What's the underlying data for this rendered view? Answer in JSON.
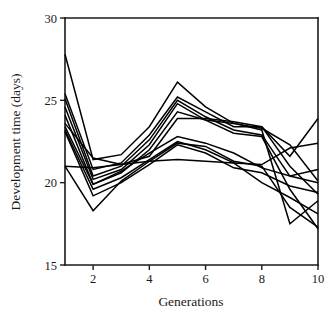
{
  "chart_data": {
    "type": "line",
    "title": "",
    "xlabel": "Generations",
    "ylabel": "Development time (days)",
    "xlim": [
      1,
      10
    ],
    "ylim": [
      15,
      30
    ],
    "x": [
      1,
      2,
      3,
      4,
      5,
      6,
      7,
      8,
      9,
      10
    ],
    "xticks": [
      2,
      4,
      6,
      8,
      10
    ],
    "xtick_labels": [
      "2",
      "4",
      "6",
      "8",
      "10"
    ],
    "yticks": [
      15,
      20,
      25,
      30
    ],
    "ytick_labels": [
      "15",
      "20",
      "25",
      "30"
    ],
    "grid": false,
    "legend": "none",
    "line_color": "#000000",
    "series": [
      {
        "name": "replicate-1",
        "values": [
          27.8,
          21.4,
          21.7,
          23.4,
          26.1,
          24.6,
          23.6,
          23.3,
          22.3,
          20.1
        ]
      },
      {
        "name": "replicate-2",
        "values": [
          25.4,
          20.8,
          21.2,
          22.9,
          25.2,
          24.3,
          23.4,
          23.4,
          21.0,
          19.3
        ]
      },
      {
        "name": "replicate-3",
        "values": [
          25.1,
          20.4,
          21.0,
          22.6,
          25.0,
          24.0,
          23.2,
          22.9,
          20.4,
          20.0
        ]
      },
      {
        "name": "replicate-4",
        "values": [
          24.6,
          20.2,
          20.8,
          22.3,
          24.8,
          23.8,
          23.0,
          22.8,
          19.6,
          17.2
        ]
      },
      {
        "name": "replicate-5",
        "values": [
          24.1,
          19.9,
          20.6,
          22.0,
          24.3,
          23.8,
          23.6,
          23.2,
          17.5,
          18.9
        ]
      },
      {
        "name": "replicate-6",
        "values": [
          23.6,
          21.5,
          21.1,
          21.6,
          23.9,
          23.9,
          23.7,
          23.4,
          21.6,
          23.9
        ]
      },
      {
        "name": "replicate-7",
        "values": [
          23.4,
          19.9,
          20.7,
          21.8,
          22.8,
          22.4,
          21.8,
          20.9,
          20.4,
          20.8
        ]
      },
      {
        "name": "replicate-8",
        "values": [
          23.2,
          19.6,
          20.3,
          21.4,
          22.5,
          22.0,
          21.2,
          20.0,
          19.1,
          18.1
        ]
      },
      {
        "name": "replicate-9",
        "values": [
          23.1,
          19.2,
          20.0,
          21.1,
          22.3,
          21.8,
          20.9,
          20.6,
          19.8,
          19.4
        ]
      },
      {
        "name": "replicate-10",
        "values": [
          21.0,
          18.3,
          20.1,
          21.3,
          22.4,
          22.2,
          21.3,
          21.0,
          18.5,
          17.3
        ]
      },
      {
        "name": "replicate-11",
        "values": [
          21.0,
          20.9,
          21.1,
          21.3,
          21.4,
          21.3,
          21.2,
          21.1,
          22.1,
          22.4
        ]
      }
    ]
  }
}
